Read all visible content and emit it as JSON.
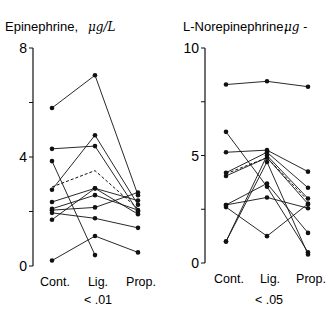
{
  "chart_data": [
    {
      "type": "line",
      "title": "Epinephrine, μg/L",
      "title_main": "Epinephrine,",
      "title_unit": "μg/L",
      "xlabel": "",
      "ylabel": "",
      "categories": [
        "Cont.",
        "Lig.",
        "Prop."
      ],
      "p_value": "< .01",
      "ylim": [
        0,
        8
      ],
      "yticks": [
        0,
        2,
        4,
        6,
        8
      ],
      "ytick_labels": [
        "0",
        "",
        "4",
        "",
        "8"
      ],
      "series": [
        {
          "name": "subject-1",
          "values": [
            5.8,
            7.0,
            2.6
          ],
          "style": "solid"
        },
        {
          "name": "subject-2",
          "values": [
            4.3,
            4.4,
            2.0
          ],
          "style": "solid"
        },
        {
          "name": "subject-3",
          "values": [
            2.8,
            4.8,
            2.25
          ],
          "style": "solid"
        },
        {
          "name": "subject-4",
          "values": [
            3.85,
            0.4,
            null
          ],
          "style": "solid"
        },
        {
          "name": "subject-5",
          "values": [
            2.35,
            2.85,
            1.9
          ],
          "style": "solid"
        },
        {
          "name": "subject-6",
          "values": [
            2.1,
            2.6,
            2.05
          ],
          "style": "solid"
        },
        {
          "name": "subject-7",
          "values": [
            2.05,
            2.15,
            2.7
          ],
          "style": "solid"
        },
        {
          "name": "subject-8",
          "values": [
            1.95,
            1.75,
            1.4
          ],
          "style": "solid"
        },
        {
          "name": "subject-9",
          "values": [
            1.7,
            2.85,
            2.4
          ],
          "style": "solid"
        },
        {
          "name": "subject-10",
          "values": [
            0.2,
            1.1,
            0.5
          ],
          "style": "solid"
        },
        {
          "name": "mean",
          "values": [
            2.9,
            3.5,
            2.1
          ],
          "style": "dashed"
        }
      ]
    },
    {
      "type": "line",
      "title": "L-Norepinephrine, μg -",
      "title_main": "L-Norepinephrine,",
      "title_unit": "μg -",
      "xlabel": "",
      "ylabel": "",
      "categories": [
        "Cont.",
        "Lig.",
        "Prop."
      ],
      "p_value": "< .05",
      "ylim": [
        0,
        10
      ],
      "yticks": [
        0,
        2.5,
        5,
        7.5,
        10
      ],
      "ytick_labels": [
        "0",
        "",
        "5",
        "",
        "10"
      ],
      "series": [
        {
          "name": "subject-1",
          "values": [
            8.3,
            8.45,
            8.2
          ],
          "style": "solid"
        },
        {
          "name": "subject-2",
          "values": [
            6.1,
            3.55,
            0.5
          ],
          "style": "solid"
        },
        {
          "name": "subject-3",
          "values": [
            5.15,
            5.25,
            4.25
          ],
          "style": "solid"
        },
        {
          "name": "subject-4",
          "values": [
            4.2,
            5.15,
            3.5
          ],
          "style": "solid"
        },
        {
          "name": "subject-5",
          "values": [
            4.05,
            4.9,
            2.75
          ],
          "style": "solid"
        },
        {
          "name": "subject-6",
          "values": [
            2.7,
            3.05,
            2.55
          ],
          "style": "solid"
        },
        {
          "name": "subject-7",
          "values": [
            2.6,
            1.25,
            2.75
          ],
          "style": "solid"
        },
        {
          "name": "subject-8",
          "values": [
            1.0,
            4.7,
            0.4
          ],
          "style": "solid"
        },
        {
          "name": "subject-9",
          "values": [
            2.7,
            3.7,
            1.4
          ],
          "style": "solid"
        },
        {
          "name": "subject-10",
          "values": [
            1.0,
            5.0,
            3.0
          ],
          "style": "solid"
        },
        {
          "name": "mean",
          "values": [
            4.15,
            4.9,
            2.9
          ],
          "style": "dashed"
        }
      ]
    }
  ],
  "colors": {
    "ink": "#111111",
    "background": "#ffffff"
  }
}
